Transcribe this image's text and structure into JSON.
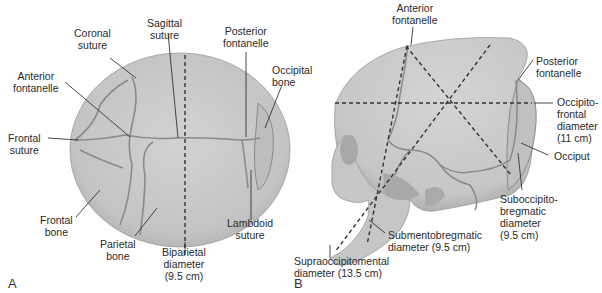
{
  "panel_a": {
    "letter": "A",
    "labels": {
      "coronal_suture": "Coronal\nsuture",
      "sagittal_suture": "Sagittal\nsuture",
      "posterior_fontanelle": "Posterior\nfontanelle",
      "occipital_bone": "Occipital\nbone",
      "anterior_fontanelle": "Anterior\nfontanelle",
      "frontal_suture": "Frontal\nsuture",
      "frontal_bone": "Frontal\nbone",
      "parietal_bone": "Parietal\nbone",
      "biparietal_diameter": "Biparietal\ndiameter\n(9.5 cm)",
      "lambdoid_suture": "Lambdoid\nsuture"
    }
  },
  "panel_b": {
    "letter": "B",
    "labels": {
      "anterior_fontanelle": "Anterior\nfontanelle",
      "posterior_fontanelle": "Posterior\nfontanelle",
      "occipitofrontal_diameter": "Occipito-\nfrontal\ndiameter\n(11 cm)",
      "occiput": "Occiput",
      "suboccipitobregmatic_diameter": "Suboccipito-\nbregmatic\ndiameter\n(9.5 cm)",
      "submentobregmatic_diameter": "Submentobregmatic\ndiameter (9.5 cm)",
      "supraoccipitomental_diameter": "Supraoccipitomental\ndiameter (13.5 cm)"
    }
  },
  "colors": {
    "bone_fill": "#c9c9c9",
    "bone_shade": "#b4b4b4",
    "suture_line": "#8a8a8a",
    "leader_line": "#333333",
    "dashed_line": "#333333"
  }
}
